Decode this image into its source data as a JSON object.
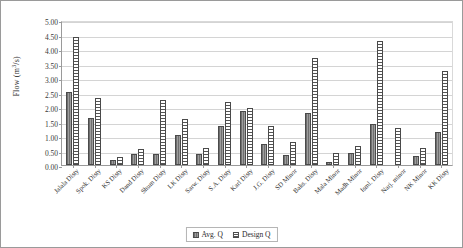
{
  "chart_data": {
    "type": "bar",
    "title": "",
    "xlabel": "",
    "ylabel": "Flow (m3/s)",
    "ylabel_base": "Flow (m",
    "ylabel_sup": "3",
    "ylabel_tail": "/s)",
    "ylim": [
      0,
      5
    ],
    "ytick_step": 0.5,
    "yticks": [
      "0.00",
      "0.50",
      "1.00",
      "1.50",
      "2.00",
      "2.50",
      "3.00",
      "3.50",
      "4.00",
      "4.50",
      "5.00"
    ],
    "grid": true,
    "legend_position": "bottom",
    "categories": [
      "Jalala Disty",
      "Spok. Disty",
      "KS Disty",
      "Dand Disty",
      "Shum Disty",
      "LK Disty",
      "Sarw. Disty",
      "S.A. Disty",
      "Karl Disty",
      "J.G. Disty",
      "SD Minor",
      "Baks. Disty",
      "Mala Minor",
      "Madh Minor",
      "Isml. Disty",
      "Narj. minor",
      "NK Minor",
      "KK Disty"
    ],
    "series": [
      {
        "name": "Avg. Q",
        "color": "#808080",
        "pattern": "solid-gray",
        "values": [
          2.52,
          1.63,
          0.18,
          0.38,
          0.38,
          1.03,
          0.38,
          1.35,
          1.85,
          0.73,
          0.34,
          1.8,
          0.12,
          0.41,
          1.42,
          null,
          0.32,
          1.15
        ]
      },
      {
        "name": "Design Q",
        "color": "#ffffff",
        "pattern": "horizontal-stripes",
        "values": [
          4.4,
          2.31,
          0.29,
          0.54,
          2.23,
          1.59,
          0.6,
          2.18,
          1.97,
          1.36,
          0.78,
          3.7,
          0.4,
          0.64,
          4.28,
          1.28,
          0.6,
          3.25
        ]
      }
    ]
  },
  "legend": {
    "items": [
      {
        "label": "Avg. Q"
      },
      {
        "label": "Design Q"
      }
    ]
  }
}
